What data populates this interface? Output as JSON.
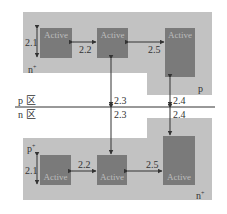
{
  "diagram": {
    "top_region": {
      "well_label": "n",
      "well_sup": "+",
      "substrate_label": "p",
      "actives": [
        {
          "label": "Active"
        },
        {
          "label": "Active"
        },
        {
          "label": "Active"
        }
      ]
    },
    "bottom_region": {
      "well_label": "p",
      "well_sup": "+",
      "substrate_label": "n",
      "substrate_sup": "+",
      "actives": [
        {
          "label": "Active"
        },
        {
          "label": "Active"
        },
        {
          "label": "Active"
        }
      ]
    },
    "zones": {
      "p_zone": "p 区",
      "n_zone": "n 区"
    },
    "dimensions": {
      "d21_top": "2.1",
      "d22_top": "2.2",
      "d25_top": "2.5",
      "d23_top": "2.3",
      "d24_top": "2.4",
      "d23_bottom": "2.3",
      "d24_bottom": "2.4",
      "d21_bottom": "2.1",
      "d22_bottom": "2.2",
      "d25_bottom": "2.5"
    },
    "colors": {
      "region": "#c2c2c2",
      "active": "#7a7a7a",
      "line": "#333333"
    }
  }
}
